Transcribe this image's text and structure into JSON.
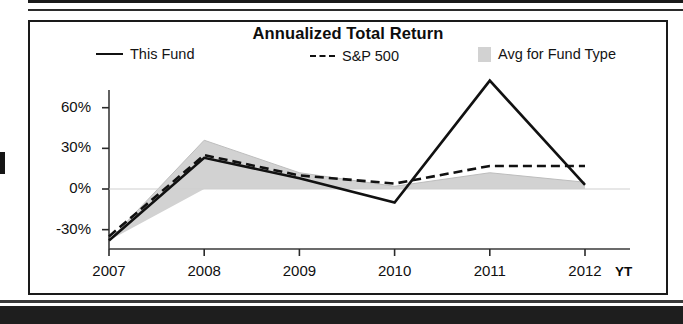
{
  "chart_data": {
    "type": "line",
    "title": "Annualized Total Return",
    "xlabel": "",
    "ylabel": "",
    "x_unit_suffix": "YT",
    "categories": [
      "2007",
      "2008",
      "2009",
      "2010",
      "2011",
      "2012"
    ],
    "ytick_labels": [
      "60%",
      "30%",
      "0%",
      "-30%"
    ],
    "ytick_values": [
      60,
      30,
      0,
      -30
    ],
    "ylim": [
      -48,
      88
    ],
    "grid": false,
    "legend_position": "top",
    "zero_line": 0,
    "series": [
      {
        "name": "This Fund",
        "style": "solid",
        "color": "#111111",
        "values": [
          -38,
          23,
          8,
          -10,
          80,
          3
        ]
      },
      {
        "name": "S&P 500",
        "style": "dashed",
        "color": "#111111",
        "values": [
          -35,
          25,
          10,
          4,
          17,
          17
        ]
      },
      {
        "name": "Avg for Fund Type",
        "style": "area",
        "color": "#d2d2d2",
        "values": [
          -38,
          36,
          12,
          2,
          12,
          5
        ],
        "band_lower": [
          -38,
          0,
          0,
          0,
          0,
          0
        ]
      }
    ]
  },
  "chart": {
    "title": "Annualized Total Return",
    "legend": [
      {
        "label": "This Fund",
        "swatch": "solid-line-swatch"
      },
      {
        "label": "S&P 500",
        "swatch": "dashed-line-swatch"
      },
      {
        "label": "Avg for Fund Type",
        "swatch": "gray-area-swatch"
      }
    ],
    "y_axis": {
      "ticks": [
        "60%",
        "30%",
        "0%",
        "-30%"
      ]
    },
    "x_axis": {
      "ticks": [
        "2007",
        "2008",
        "2009",
        "2010",
        "2011",
        "2012"
      ],
      "unit_suffix": "YT"
    }
  },
  "colors": {
    "line": "#111111",
    "area": "#d2d2d2",
    "frame": "#1a1a1a",
    "background": "#ffffff"
  }
}
